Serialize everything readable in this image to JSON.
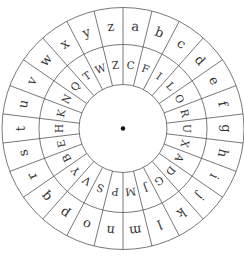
{
  "diagram": {
    "type": "caesar-cipher-wheel",
    "segments": 26,
    "outer_ring": {
      "letters": [
        "a",
        "b",
        "c",
        "d",
        "e",
        "f",
        "g",
        "h",
        "i",
        "j",
        "k",
        "l",
        "m",
        "n",
        "o",
        "p",
        "q",
        "r",
        "s",
        "t",
        "u",
        "v",
        "w",
        "x",
        "y",
        "z"
      ]
    },
    "inner_ring": {
      "letters": [
        "C",
        "F",
        "I",
        "L",
        "O",
        "R",
        "U",
        "X",
        "A",
        "D",
        "G",
        "J",
        "M",
        "P",
        "S",
        "V",
        "Y",
        "B",
        "E",
        "H",
        "K",
        "N",
        "Q",
        "T",
        "W",
        "Z"
      ]
    },
    "center": {
      "marker": "pivot-dot"
    },
    "colors": {
      "line": "#555555",
      "text": "#333333",
      "background": "#ffffff",
      "pivot": "#111111"
    }
  }
}
